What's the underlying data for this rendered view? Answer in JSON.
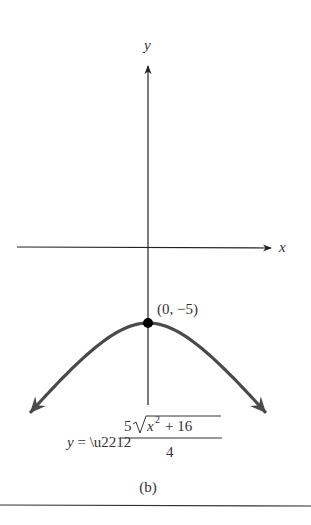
{
  "chart_data": {
    "type": "line",
    "title": "",
    "caption": "(b)",
    "xlabel": "x",
    "ylabel": "y",
    "grid": false,
    "xlim": [
      -8.3,
      8.3
    ],
    "ylim": [
      -12,
      12
    ],
    "series": [
      {
        "name": "y = -5*sqrt(x^2 + 16)/4",
        "function": "hyperbola-lower-branch",
        "x_range": [
          -7.7,
          7.7
        ],
        "both_ends_arrows": true,
        "color": "#4a4a4a"
      }
    ],
    "points": [
      {
        "x": 0,
        "y": -5,
        "label": "(0, −5)"
      }
    ],
    "equation": {
      "lhs": "y = −",
      "numerator_coef": "5",
      "radicand_var": "x",
      "radicand_exp": "2",
      "radicand_rest": "+ 16",
      "denominator": "4"
    }
  },
  "colors": {
    "axis": "#222222",
    "curve": "#4a4a4a",
    "point": "#000000",
    "rule": "#333333"
  }
}
